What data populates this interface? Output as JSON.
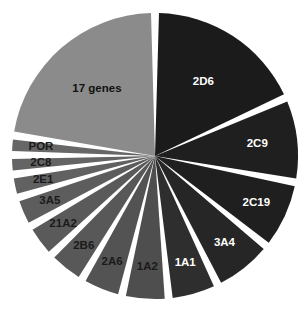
{
  "chart_data": {
    "type": "pie",
    "title": "",
    "subtitle": "",
    "xlabel": "",
    "ylabel": "",
    "legend_position": "none",
    "grid": false,
    "exploded": true,
    "start_angle_deg": 0,
    "direction": "clockwise",
    "label_placement": "inside-slice",
    "categories": [
      "2D6",
      "2C9",
      "2C19",
      "3A4",
      "1A1",
      "1A2",
      "2A6",
      "2B6",
      "21A2",
      "3A5",
      "2E1",
      "2C8",
      "POR",
      "17 genes"
    ],
    "values": [
      21.0,
      11.0,
      9.0,
      8.0,
      6.5,
      6.0,
      5.5,
      5.0,
      4.5,
      4.0,
      3.0,
      2.5,
      2.5,
      26.0
    ],
    "slices": [
      {
        "label": "2D6",
        "value": 21.0,
        "color": "#1b1b1b",
        "label_color": "#ffffff"
      },
      {
        "label": "2C9",
        "value": 11.0,
        "color": "#1f1f1f",
        "label_color": "#ffffff"
      },
      {
        "label": "2C19",
        "value": 9.0,
        "color": "#1f1f1f",
        "label_color": "#ffffff"
      },
      {
        "label": "3A4",
        "value": 8.0,
        "color": "#262626",
        "label_color": "#ffffff"
      },
      {
        "label": "1A1",
        "value": 6.5,
        "color": "#2e2e2e",
        "label_color": "#ffffff"
      },
      {
        "label": "1A2",
        "value": 6.0,
        "color": "#4e4e4e",
        "label_color": "#1a1a1a"
      },
      {
        "label": "2A6",
        "value": 5.5,
        "color": "#535353",
        "label_color": "#1a1a1a"
      },
      {
        "label": "2B6",
        "value": 5.0,
        "color": "#585858",
        "label_color": "#1a1a1a"
      },
      {
        "label": "21A2",
        "value": 4.5,
        "color": "#5a5a5a",
        "label_color": "#1a1a1a"
      },
      {
        "label": "3A5",
        "value": 4.0,
        "color": "#5d5d5d",
        "label_color": "#1a1a1a"
      },
      {
        "label": "2E1",
        "value": 3.0,
        "color": "#616161",
        "label_color": "#1a1a1a"
      },
      {
        "label": "2C8",
        "value": 2.5,
        "color": "#646464",
        "label_color": "#1a1a1a"
      },
      {
        "label": "POR",
        "value": 2.5,
        "color": "#676767",
        "label_color": "#1a1a1a"
      },
      {
        "label": "17 genes",
        "value": 26.0,
        "color": "#8b8b8b",
        "label_color": "#111111"
      }
    ],
    "colors": {
      "background": "#ffffff",
      "dark_slice": "#1f1f1f",
      "medium_slice": "#595959",
      "light_slice": "#8b8b8b",
      "light_label": "#ffffff",
      "dark_label": "#1a1a1a"
    },
    "geometry": {
      "center_x": 155,
      "center_y": 156,
      "radius": 143,
      "gap_deg": 3.2
    }
  }
}
